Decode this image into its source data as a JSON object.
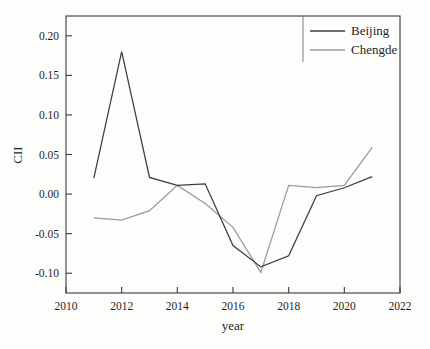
{
  "chart_data": {
    "type": "line",
    "title": "",
    "xlabel": "year",
    "ylabel": "CII",
    "x": [
      2011,
      2012,
      2013,
      2014,
      2015,
      2016,
      2017,
      2018,
      2019,
      2020,
      2021
    ],
    "xlim": [
      2010,
      2022
    ],
    "ylim": [
      -0.125,
      0.225
    ],
    "xticks": [
      2010,
      2012,
      2014,
      2016,
      2018,
      2020,
      2022
    ],
    "xticklabels": [
      "2010",
      "2012",
      "2014",
      "2016",
      "2018",
      "2020",
      "2022"
    ],
    "yticks": [
      -0.1,
      -0.05,
      0.0,
      0.05,
      0.1,
      0.15,
      0.2
    ],
    "yticklabels": [
      "-0.10",
      "-0.05",
      "0.00",
      "0.05",
      "0.10",
      "0.15",
      "0.20"
    ],
    "grid": false,
    "legend_position": "top-right",
    "series": [
      {
        "name": "Beijing",
        "color": "#3c3c3c",
        "values": [
          0.02,
          0.18,
          0.021,
          0.011,
          0.013,
          -0.065,
          -0.092,
          -0.078,
          -0.002,
          0.008,
          0.022
        ]
      },
      {
        "name": "Chengde",
        "color": "#9a9a9a",
        "values": [
          -0.03,
          -0.033,
          -0.021,
          0.011,
          -0.012,
          -0.042,
          -0.099,
          0.011,
          0.008,
          0.011,
          0.059
        ]
      }
    ]
  },
  "legend": {
    "items": [
      {
        "label": "Beijing",
        "color": "#3c3c3c"
      },
      {
        "label": "Chengde",
        "color": "#9a9a9a"
      }
    ]
  },
  "axes": {
    "x_title": "year",
    "y_title": "CII"
  }
}
